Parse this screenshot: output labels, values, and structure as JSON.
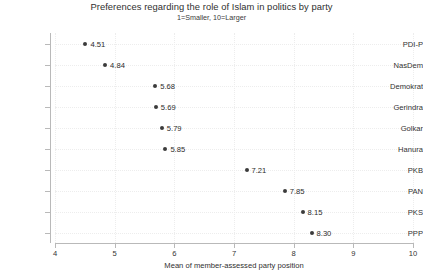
{
  "chart_data": {
    "type": "scatter",
    "title": "Preferences regarding the role of Islam in politics by party",
    "subtitle": "1=Smaller, 10=Larger",
    "xlabel": "Mean of member-assessed party position",
    "ylabel": "",
    "xlim": [
      4,
      10
    ],
    "xticks": [
      4,
      5,
      6,
      7,
      8,
      9,
      10
    ],
    "xtick_labels": [
      "4",
      "5",
      "6",
      "7",
      "8",
      "9",
      "10"
    ],
    "grid": true,
    "grid_style": "dotted",
    "legend": "none",
    "marker_color": "#3b3b3b",
    "categories": [
      "PDI-P",
      "NasDem",
      "Demokrat",
      "Gerindra",
      "Golkar",
      "Hanura",
      "PKB",
      "PAN",
      "PKS",
      "PPP"
    ],
    "values": [
      4.51,
      4.84,
      5.68,
      5.69,
      5.79,
      5.85,
      7.21,
      7.85,
      8.15,
      8.3
    ],
    "value_labels": [
      "4.51",
      "4.84",
      "5.68",
      "5.69",
      "5.79",
      "5.85",
      "7.21",
      "7.85",
      "8.15",
      "8.30"
    ],
    "points": [
      {
        "category": "PDI-P",
        "value": 4.51,
        "label": "4.51"
      },
      {
        "category": "NasDem",
        "value": 4.84,
        "label": "4.84"
      },
      {
        "category": "Demokrat",
        "value": 5.68,
        "label": "5.68"
      },
      {
        "category": "Gerindra",
        "value": 5.69,
        "label": "5.69"
      },
      {
        "category": "Golkar",
        "value": 5.79,
        "label": "5.79"
      },
      {
        "category": "Hanura",
        "value": 5.85,
        "label": "5.85"
      },
      {
        "category": "PKB",
        "value": 7.21,
        "label": "7.21"
      },
      {
        "category": "PAN",
        "value": 7.85,
        "label": "7.85"
      },
      {
        "category": "PKS",
        "value": 8.15,
        "label": "8.15"
      },
      {
        "category": "PPP",
        "value": 8.3,
        "label": "8.30"
      }
    ]
  }
}
